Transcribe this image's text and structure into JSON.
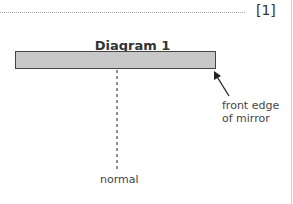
{
  "marks": "[1]",
  "diagram": {
    "title": "Diagram 1",
    "labels": {
      "normal": "normal",
      "front_edge_line1": "front edge",
      "front_edge_line2": "of mirror"
    }
  }
}
